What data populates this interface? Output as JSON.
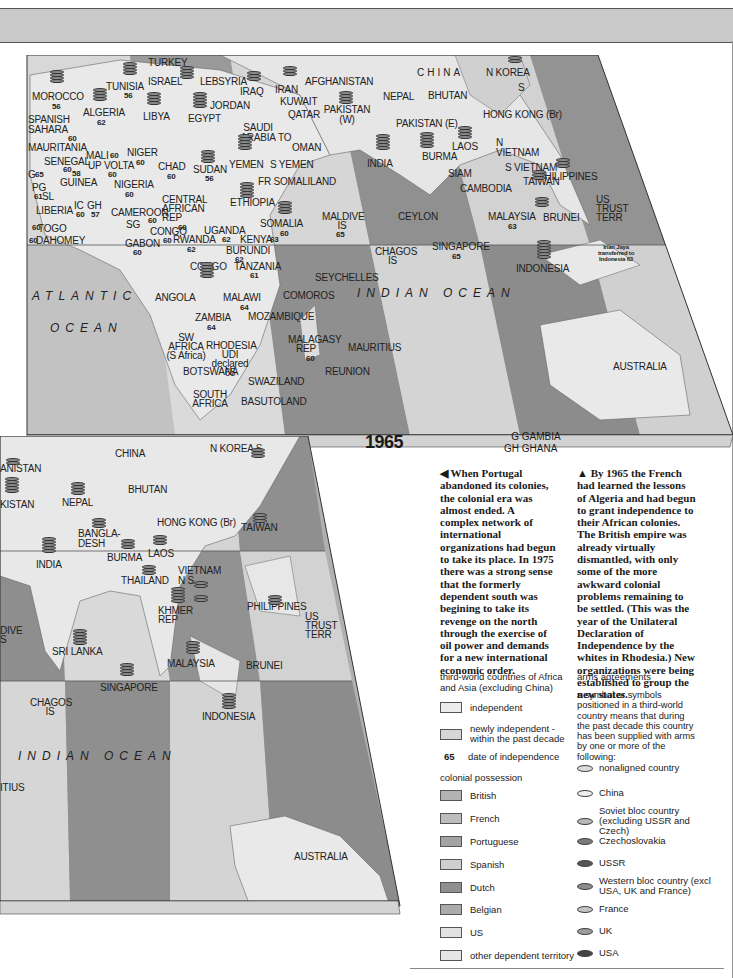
{
  "header_band": {
    "color": "#c9c9c9"
  },
  "map_1965": {
    "year_label": "1965",
    "oceans": [
      "ATLANTIC",
      "OCEAN",
      "INDIAN OCEAN"
    ],
    "countries": [
      {
        "name": "TURKEY"
      },
      {
        "name": "ISRAEL"
      },
      {
        "name": "LEB"
      },
      {
        "name": "SYRIA"
      },
      {
        "name": "IRAQ"
      },
      {
        "name": "IRAN"
      },
      {
        "name": "AFGHANISTAN"
      },
      {
        "name": "CHINA"
      },
      {
        "name": "N KOREA"
      },
      {
        "name": "S"
      },
      {
        "name": "MOROCCO",
        "year": "56"
      },
      {
        "name": "TUNISIA",
        "year": "56"
      },
      {
        "name": "ALGERIA",
        "year": "62"
      },
      {
        "name": "LIBYA"
      },
      {
        "name": "EGYPT"
      },
      {
        "name": "JORDAN"
      },
      {
        "name": "KUWAIT"
      },
      {
        "name": "QATAR"
      },
      {
        "name": "PAKISTAN (W)"
      },
      {
        "name": "NEPAL"
      },
      {
        "name": "BHUTAN"
      },
      {
        "name": "HONG KONG (Br)"
      },
      {
        "name": "TAIWAN"
      },
      {
        "name": "SPANISH SAHARA"
      },
      {
        "name": "SAUDI ARABIA"
      },
      {
        "name": "TO"
      },
      {
        "name": "OMAN"
      },
      {
        "name": "PAKISTAN (E)"
      },
      {
        "name": "MAURITANIA",
        "year": "60"
      },
      {
        "name": "MALI",
        "year": "60"
      },
      {
        "name": "NIGER",
        "year": "60"
      },
      {
        "name": "CHAD",
        "year": "60"
      },
      {
        "name": "SUDAN",
        "year": "56"
      },
      {
        "name": "YEMEN"
      },
      {
        "name": "S YEMEN"
      },
      {
        "name": "INDIA"
      },
      {
        "name": "BURMA"
      },
      {
        "name": "LAOS"
      },
      {
        "name": "N VIETNAM"
      },
      {
        "name": "S VIETNAM"
      },
      {
        "name": "SIAM"
      },
      {
        "name": "CAMBODIA"
      },
      {
        "name": "PHILIPPINES"
      },
      {
        "name": "US TRUST TERR"
      },
      {
        "name": "SENEGAL",
        "year": "60"
      },
      {
        "name": "G",
        "year": "65"
      },
      {
        "name": "UP VOLTA",
        "year": "60"
      },
      {
        "name": "GUINEA",
        "year": "58"
      },
      {
        "name": "PG"
      },
      {
        "name": "SL",
        "year": "61"
      },
      {
        "name": "NIGERIA",
        "year": "60"
      },
      {
        "name": "FR SOMALILAND"
      },
      {
        "name": "LIBERIA"
      },
      {
        "name": "IC",
        "year": "60"
      },
      {
        "name": "GH",
        "year": "57"
      },
      {
        "name": "CENTRAL AFRICAN REP",
        "year": "60"
      },
      {
        "name": "ETHIOPIA"
      },
      {
        "name": "CAMEROON",
        "year": "60"
      },
      {
        "name": "MALDIVE IS",
        "year": "65"
      },
      {
        "name": "CEYLON"
      },
      {
        "name": "MALAYSIA",
        "year": "63"
      },
      {
        "name": "BRUNEI"
      },
      {
        "name": "TOGO",
        "year": "60"
      },
      {
        "name": "SG"
      },
      {
        "name": "CONGO",
        "year": "60"
      },
      {
        "name": "UGANDA",
        "year": "62"
      },
      {
        "name": "SOMALIA",
        "year": "60"
      },
      {
        "name": "DAHOMEY",
        "year": "60"
      },
      {
        "name": "GABON",
        "year": "60"
      },
      {
        "name": "RWANDA",
        "year": "62"
      },
      {
        "name": "KENYA",
        "year": "63"
      },
      {
        "name": "BURUNDI",
        "year": "62"
      },
      {
        "name": "CHAGOS IS"
      },
      {
        "name": "SINGAPORE",
        "year": "65"
      },
      {
        "name": "CONGO",
        "year": "60"
      },
      {
        "name": "TANZANIA",
        "year": "61"
      },
      {
        "name": "SEYCHELLES"
      },
      {
        "name": "INDONESIA"
      },
      {
        "name": "Irian Jaya transferred to Indonesia 63"
      },
      {
        "name": "ANGOLA"
      },
      {
        "name": "MALAWI",
        "year": "64"
      },
      {
        "name": "COMOROS"
      },
      {
        "name": "ZAMBIA",
        "year": "64"
      },
      {
        "name": "MOZAMBIQUE"
      },
      {
        "name": "SW AFRICA (S Africa)"
      },
      {
        "name": "RHODESIA UDI declared 65"
      },
      {
        "name": "MALAGASY REP",
        "year": "60"
      },
      {
        "name": "MAURITIUS"
      },
      {
        "name": "AUSTRALIA"
      },
      {
        "name": "BOTSWANA"
      },
      {
        "name": "REUNION"
      },
      {
        "name": "SWAZILAND"
      },
      {
        "name": "SOUTH AFRICA"
      },
      {
        "name": "BASUTOLAND"
      }
    ],
    "abbreviations": [
      {
        "code": "G",
        "name": "GAMBIA"
      },
      {
        "code": "GH",
        "name": "GHANA"
      },
      {
        "code": "IC",
        "name": "IVORY COAST"
      },
      {
        "code": "PG",
        "name": "PORTUGUESE GUINEA"
      },
      {
        "code": "SL",
        "name": "SIERRA LEONE"
      },
      {
        "code": "SG",
        "name": "SPANISH GUINEA"
      },
      {
        "code": "TO",
        "name": "TRUCIAL OMAN"
      }
    ]
  },
  "map_1975": {
    "oceans": [
      "INDIAN OCEAN"
    ],
    "countries": [
      {
        "name": "ANISTAN"
      },
      {
        "name": "CHINA"
      },
      {
        "name": "N KOREA S"
      },
      {
        "name": "KISTAN"
      },
      {
        "name": "NEPAL"
      },
      {
        "name": "BHUTAN"
      },
      {
        "name": "BANGLA-DESH"
      },
      {
        "name": "HONG KONG (Br)"
      },
      {
        "name": "TAIWAN"
      },
      {
        "name": "INDIA"
      },
      {
        "name": "BURMA"
      },
      {
        "name": "LAOS"
      },
      {
        "name": "THAILAND"
      },
      {
        "name": "VIETNAM N S"
      },
      {
        "name": "KHMER REP"
      },
      {
        "name": "PHILIPPINES"
      },
      {
        "name": "US TRUST TERR"
      },
      {
        "name": "DIVE S"
      },
      {
        "name": "SRI LANKA"
      },
      {
        "name": "MALAYSIA"
      },
      {
        "name": "BRUNEI"
      },
      {
        "name": "SINGAPORE"
      },
      {
        "name": "CHAGOS IS"
      },
      {
        "name": "INDONESIA"
      },
      {
        "name": "ITIUS"
      },
      {
        "name": "AUSTRALIA"
      }
    ]
  },
  "captions": {
    "left": "◀ When Portugal abandoned its colonies, the colonial era was almost ended. A complex network of international organizations had begun to take its place. In 1975 there was a strong sense that the formerly dependent south was begining to take its revenge on the north through the exercise of oil power and demands for a new international economic order.",
    "right": "▲ By 1965 the French had learned the lessons of Algeria and had begun to grant independence to their African colonies. The British empire was already virtually dismantled, with only some of the more awkward colonial problems remaining to be settled. (This was the year of the Unilateral Declaration of Independence by the whites in Rhodesia.) New organizations were being established to group the new states."
  },
  "legend_left": {
    "title": "third-world countries of Africa and Asia (excluding China)",
    "status": [
      {
        "label": "independent",
        "color": "#ececec"
      },
      {
        "label": "newly independent - within the past decade",
        "color": "#d6d6d6"
      }
    ],
    "date_sample": "65",
    "date_label": "date of independence",
    "colonial_title": "colonial possession",
    "colonial": [
      {
        "label": "British",
        "color": "#b3b3b3"
      },
      {
        "label": "French",
        "color": "#bdbdbd"
      },
      {
        "label": "Portuguese",
        "color": "#a3a3a3"
      },
      {
        "label": "Spanish",
        "color": "#cfcfcf"
      },
      {
        "label": "Dutch",
        "color": "#8f8f8f"
      },
      {
        "label": "Belgian",
        "color": "#ababab"
      },
      {
        "label": "US",
        "color": "#e2e2e2"
      },
      {
        "label": "other dependent territory",
        "color": "#e6e6e6"
      }
    ]
  },
  "legend_right": {
    "title": "arms agreements",
    "description": "a symbol or symbols positioned in a third-world country means that during the past decade this country has been supplied with arms by one or more of the following:",
    "suppliers": [
      {
        "label": "nonaligned country",
        "color": "#dcdcdc"
      },
      {
        "label": "China",
        "color": "#eeeeee"
      },
      {
        "label": "Soviet bloc country (excluding USSR and Czech)",
        "color": "#b8b8b8"
      },
      {
        "label": "Czechoslovakia",
        "color": "#7a7a7a"
      },
      {
        "label": "USSR",
        "color": "#555555"
      },
      {
        "label": "Western bloc country (excl USA, UK and France)",
        "color": "#8c8c8c"
      },
      {
        "label": "France",
        "color": "#c4c4c4"
      },
      {
        "label": "UK",
        "color": "#9e9e9e"
      },
      {
        "label": "USA",
        "color": "#444444"
      }
    ]
  }
}
